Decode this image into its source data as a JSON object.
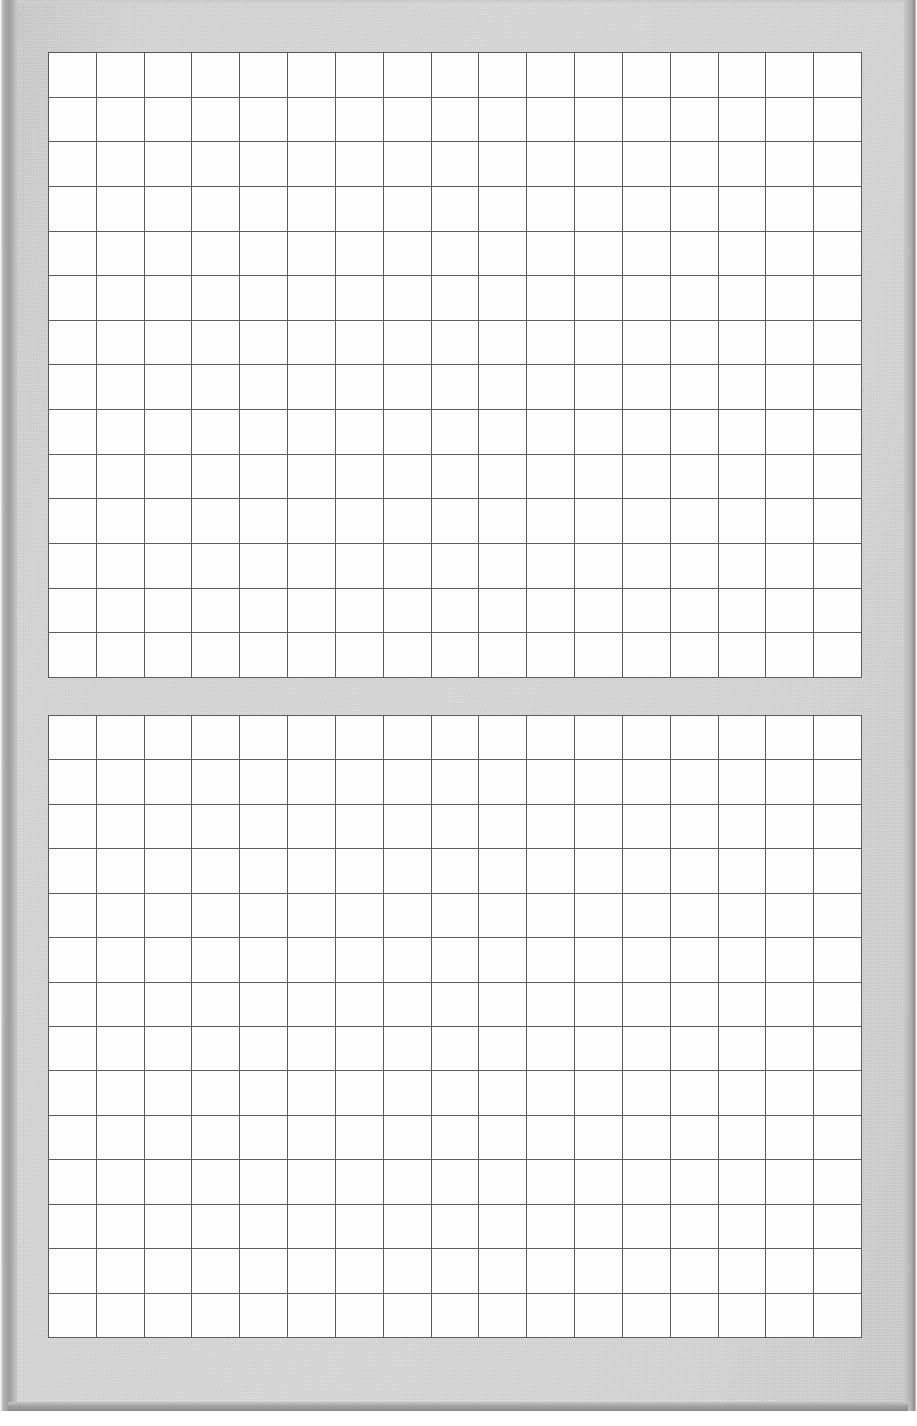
{
  "document": {
    "kind": "scanned-grid-paper",
    "title": "Blank grid-ruled worksheet (scanned)",
    "page_width_px": 917,
    "page_height_px": 1426,
    "background_color": "#ffffff",
    "paper_color": "#d3d3d3",
    "gridline_color": "#5c5c5c",
    "cell_fill_color": "#fefefe",
    "edge_shadow_color": "#8e8e8e",
    "text_content": "",
    "handwriting_present": "no",
    "printed_labels": "none"
  },
  "paper": {
    "name": "paper-sheet",
    "left_px": 8,
    "top_px": 0,
    "width_px": 900,
    "height_px": 1411
  },
  "grids": [
    {
      "name": "grid-top",
      "label": "Upper blank grid table",
      "columns": 17,
      "rows": 14,
      "left_px": 40,
      "top_px": 52,
      "width_px": 814,
      "height_px": 626,
      "cell_width_px": 47.9,
      "cell_height_px": 44.7,
      "contents": "empty"
    },
    {
      "name": "grid-bottom",
      "label": "Lower blank grid table",
      "columns": 17,
      "rows": 14,
      "left_px": 40,
      "top_px": 715,
      "width_px": 814,
      "height_px": 623,
      "cell_width_px": 47.9,
      "cell_height_px": 44.5,
      "contents": "empty"
    }
  ],
  "chart_data": {
    "type": "table",
    "title": "",
    "xlabel": "",
    "ylabel": "",
    "note": "Two empty grid tables; no data values, headers, axis ticks or legend are printed on the page.",
    "tables": [
      {
        "name": "upper-table",
        "columns": 17,
        "rows": 14,
        "headers": [],
        "cells": []
      },
      {
        "name": "lower-table",
        "columns": 17,
        "rows": 14,
        "headers": [],
        "cells": []
      }
    ]
  }
}
